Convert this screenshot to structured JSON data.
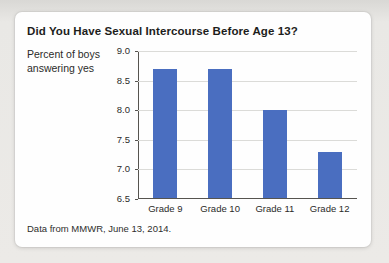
{
  "figure": {
    "title": "Did You Have Sexual Intercourse Before Age 13?",
    "y_axis_note": "Percent of boys\nanswering yes",
    "source_caption": "Data from MMWR, June 13, 2014."
  },
  "colors": {
    "bar": "#4a6ec0",
    "gridline": "#dbdbd8",
    "axis": "#56544f",
    "card_background": "#fefefe",
    "page_background": "#e9e8e5"
  },
  "chart_data": {
    "type": "bar",
    "title": "Did You Have Sexual Intercourse Before Age 13?",
    "categories": [
      "Grade 9",
      "Grade 10",
      "Grade 11",
      "Grade 12"
    ],
    "values": [
      8.7,
      8.7,
      8.0,
      7.3
    ],
    "xlabel": "",
    "ylabel": "Percent of boys answering yes",
    "ylim": [
      6.5,
      9.0
    ],
    "ytick_step": 0.5,
    "ytick_labels": [
      "9.0",
      "8.5",
      "8.0",
      "7.5",
      "7.0",
      "6.5"
    ],
    "grid": true,
    "legend": "none",
    "bar_color": "#4a6ec0",
    "source": "Data from MMWR, June 13, 2014."
  }
}
